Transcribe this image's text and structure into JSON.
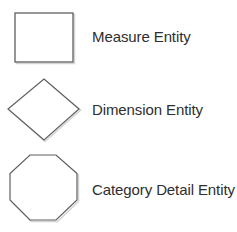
{
  "legend": {
    "items": [
      {
        "shape": "rectangle-icon",
        "label": "Measure Entity"
      },
      {
        "shape": "diamond-icon",
        "label": "Dimension Entity"
      },
      {
        "shape": "octagon-icon",
        "label": "Category Detail Entity"
      }
    ]
  },
  "colors": {
    "stroke": "#5f5f5f",
    "shadow": "#cfcfcf",
    "fill": "#ffffff",
    "text": "#2e2e2e"
  }
}
